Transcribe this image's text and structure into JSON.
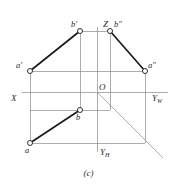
{
  "figure": {
    "caption": "(c)",
    "type": "orthographic-projection-diagram",
    "colors": {
      "thin_line": "#8a8a8a",
      "thick_line": "#1a1a1a",
      "diagonal_line": "#9a9a9a",
      "label_text": "#2b2b2b",
      "background": "#ffffff",
      "marker_fill": "#ffffff"
    },
    "axes": [
      {
        "name": "Z",
        "label": "Z",
        "subscript": "",
        "x": 103,
        "y": 24
      },
      {
        "name": "X",
        "label": "X",
        "subscript": "",
        "x": 12,
        "y": 99
      },
      {
        "name": "YW",
        "label": "Y",
        "subscript": "W",
        "x": 152,
        "y": 99
      },
      {
        "name": "YH",
        "label": "Y",
        "subscript": "H",
        "x": 94,
        "y": 155
      },
      {
        "name": "O",
        "label": "O",
        "subscript": "",
        "x": 99,
        "y": 88
      }
    ],
    "points": [
      {
        "name": "b-prime",
        "label": "b",
        "prime": "′",
        "cx": 80,
        "cy": 31,
        "label_x": 70,
        "label_y": 25
      },
      {
        "name": "b-double-prime",
        "label": "b",
        "prime": "″",
        "cx": 110,
        "cy": 31,
        "label_x": 114,
        "label_y": 25
      },
      {
        "name": "a-prime",
        "label": "a",
        "prime": "′",
        "cx": 30,
        "cy": 71,
        "label_x": 16,
        "label_y": 65
      },
      {
        "name": "a-double-prime",
        "label": "a",
        "prime": "″",
        "cx": 145,
        "cy": 71,
        "label_x": 149,
        "label_y": 65
      },
      {
        "name": "b",
        "label": "b",
        "prime": "",
        "cx": 80,
        "cy": 110,
        "label_x": 77,
        "label_y": 114
      },
      {
        "name": "a",
        "label": "a",
        "prime": "",
        "cx": 30,
        "cy": 143,
        "label_x": 26,
        "label_y": 147
      }
    ],
    "projection_lines": [
      {
        "name": "ab-front-view",
        "x1": 30,
        "y1": 71,
        "x2": 80,
        "y2": 31
      },
      {
        "name": "ab-side-view",
        "x1": 110,
        "y1": 31,
        "x2": 145,
        "y2": 71
      },
      {
        "name": "ab-top-view",
        "x1": 30,
        "y1": 143,
        "x2": 80,
        "y2": 110
      }
    ],
    "construction_lines": [
      {
        "name": "z-axis",
        "x1": 97,
        "y1": 27,
        "x2": 97,
        "y2": 92
      },
      {
        "name": "yh-axis",
        "x1": 97,
        "y1": 92,
        "x2": 97,
        "y2": 152
      },
      {
        "name": "x-axis",
        "x1": 22,
        "y1": 92,
        "x2": 97,
        "y2": 92
      },
      {
        "name": "yw-axis",
        "x1": 97,
        "y1": 92,
        "x2": 168,
        "y2": 92
      },
      {
        "name": "bprime-bdprime-connector",
        "x1": 80,
        "y1": 31,
        "x2": 110,
        "y2": 31
      },
      {
        "name": "aprime-adprime-connector",
        "x1": 30,
        "y1": 71,
        "x2": 145,
        "y2": 71
      },
      {
        "name": "b-level-horizontal",
        "x1": 30,
        "y1": 110,
        "x2": 110,
        "y2": 110
      },
      {
        "name": "a-level-horizontal",
        "x1": 30,
        "y1": 143,
        "x2": 145,
        "y2": 143
      },
      {
        "name": "left-vertical-a",
        "x1": 30,
        "y1": 71,
        "x2": 30,
        "y2": 143
      },
      {
        "name": "bprime-b-vertical",
        "x1": 80,
        "y1": 31,
        "x2": 80,
        "y2": 110
      },
      {
        "name": "bdprime-vertical",
        "x1": 110,
        "y1": 31,
        "x2": 110,
        "y2": 110
      },
      {
        "name": "right-vertical-a",
        "x1": 145,
        "y1": 71,
        "x2": 145,
        "y2": 143
      }
    ],
    "diagonal": {
      "name": "45-degree-bisector",
      "x1": 97,
      "y1": 92,
      "x2": 163,
      "y2": 158
    }
  }
}
